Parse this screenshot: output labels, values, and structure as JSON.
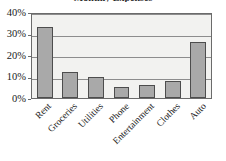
{
  "chart_data": {
    "type": "bar",
    "title": "Monthly Expenses",
    "xlabel": "",
    "ylabel": "",
    "categories": [
      "Rent",
      "Groceries",
      "Utilities",
      "Phone",
      "Entertainment",
      "Clothes",
      "Auto"
    ],
    "values": [
      33,
      12,
      10,
      5,
      6,
      8,
      26
    ],
    "ylim": [
      0,
      40
    ],
    "ytick_values": [
      0,
      10,
      20,
      30,
      40
    ],
    "ytick_labels": [
      "0%",
      "10%",
      "20%",
      "30%",
      "40%"
    ],
    "grid": true,
    "legend": false,
    "legend_position": "none",
    "bar_color": "#a9a9a9",
    "bar_edge_color": "#4d4d4d",
    "plot_background": "#f2f2f0",
    "gridline_color": "#8d8d8d",
    "axis_color": "#6b6b6b"
  }
}
